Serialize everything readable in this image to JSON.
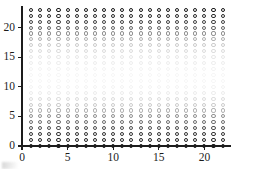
{
  "chart_data": {
    "type": "scatter",
    "title": "",
    "subtitle": "",
    "xlabel": "",
    "ylabel": "",
    "xlim": [
      0,
      22.8
    ],
    "ylim": [
      0,
      23.6
    ],
    "grid": false,
    "legend": null,
    "marker": {
      "shape": "open-circle",
      "edge_color": "#1a1a1a",
      "fill": "none",
      "size_px": 4.1
    },
    "x_ticks": [
      0,
      5,
      10,
      15,
      20
    ],
    "x_tick_labels": [
      "0",
      "5",
      "10",
      "15",
      "20"
    ],
    "y_ticks": [
      0,
      5,
      10,
      15,
      20
    ],
    "y_tick_labels": [
      "0",
      "5",
      "10",
      "15",
      "20"
    ],
    "x_values": [
      1,
      2,
      3,
      4,
      5,
      6,
      7,
      8,
      9,
      10,
      11,
      12,
      13,
      14,
      15,
      16,
      17,
      18,
      19,
      20,
      21,
      22
    ],
    "y_values": [
      0,
      1,
      2,
      3,
      4,
      5,
      6,
      7,
      8,
      9,
      10,
      11,
      12,
      13,
      14,
      15,
      16,
      17,
      18,
      19,
      20,
      21,
      22,
      23
    ],
    "alpha_by_y": [
      1.0,
      0.95,
      0.88,
      0.76,
      0.62,
      0.47,
      0.33,
      0.22,
      0.14,
      0.08,
      0.05,
      0.04,
      0.04,
      0.05,
      0.07,
      0.1,
      0.15,
      0.22,
      0.33,
      0.48,
      0.66,
      0.82,
      0.93,
      1.0
    ],
    "axes": {
      "spines": [
        "left",
        "bottom"
      ],
      "spine_color": "#1c1c1c"
    }
  }
}
